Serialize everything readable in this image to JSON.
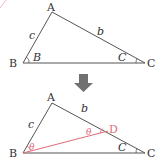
{
  "diagram": {
    "top": {
      "vertices": {
        "A": "A",
        "B": "B",
        "C": "C"
      },
      "sides": {
        "c": "c",
        "b": "b"
      },
      "angles": {
        "B": "B",
        "C": "C"
      }
    },
    "arrow": "down-arrow",
    "bottom": {
      "vertices": {
        "A": "A",
        "B": "B",
        "C": "C",
        "D": "D"
      },
      "sides": {
        "c": "c",
        "b": "b"
      },
      "angles": {
        "theta1": "θ",
        "theta2": "θ",
        "C": "C"
      }
    },
    "colors": {
      "line": "#555555",
      "accent": "#e06a78",
      "arrow": "#707070"
    }
  }
}
